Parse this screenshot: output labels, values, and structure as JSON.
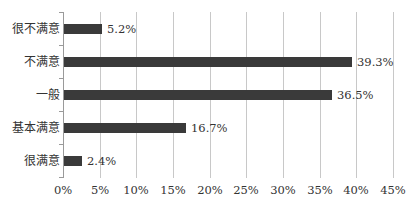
{
  "chart_data": {
    "type": "bar",
    "orientation": "horizontal",
    "title": "",
    "xlabel": "",
    "ylabel": "",
    "categories": [
      "很不满意",
      "不满意",
      "一般",
      "基本满意",
      "很满意"
    ],
    "values": [
      5.2,
      39.3,
      36.5,
      16.7,
      2.4
    ],
    "value_labels": [
      "5.2%",
      "39.3%",
      "36.5%",
      "16.7%",
      "2.4%"
    ],
    "xlim": [
      0,
      45
    ],
    "x_ticks": [
      "0%",
      "5%",
      "10%",
      "15%",
      "20%",
      "25%",
      "30%",
      "35%",
      "40%",
      "45%"
    ],
    "grid": true,
    "legend": null,
    "bar_color": "#3a3a3a"
  }
}
